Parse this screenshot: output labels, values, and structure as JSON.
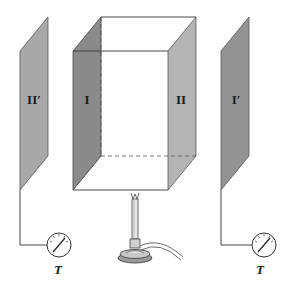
{
  "figure": {
    "panels": [
      {
        "id": "II-prime",
        "label": "II′",
        "color": "#a8a8a8"
      },
      {
        "id": "I",
        "label": "I",
        "color": "#8a8a8a"
      },
      {
        "id": "II",
        "label": "II",
        "color": "#b4b4b4"
      },
      {
        "id": "I-prime",
        "label": "I′",
        "color": "#939393"
      }
    ],
    "thermometers": [
      {
        "id": "left",
        "label": "T"
      },
      {
        "id": "right",
        "label": "T"
      }
    ],
    "burner": {
      "name": "bunsen-burner"
    }
  }
}
